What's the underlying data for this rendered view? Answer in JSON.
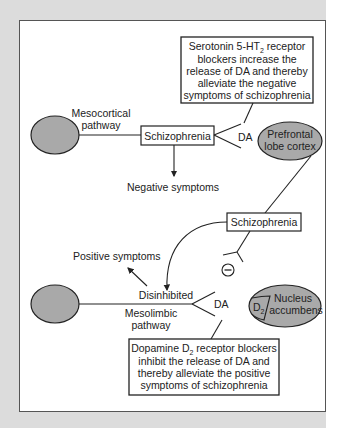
{
  "figure": {
    "title_cutoff": "",
    "colors": {
      "background": "#dcdcdc",
      "panel": "#ffffff",
      "ellipse_fill": "#a9a9a9",
      "stroke": "#222222"
    },
    "top_box": {
      "lines": [
        "Serotonin 5-HT",
        "blockers increase the",
        "release of DA and thereby",
        "alleviate the negative",
        "symptoms of schizophrenia"
      ],
      "line1_sub": "2",
      "line1_suffix": " receptor"
    },
    "mesocortical": {
      "label_line1": "Mesocortical",
      "label_line2": "pathway",
      "schizophrenia_box": "Schizophrenia",
      "da_label": "DA",
      "negative_symptoms": "Negative symptoms",
      "target_line1": "Prefrontal",
      "target_line2": "lobe cortex"
    },
    "middle": {
      "schizophrenia_box": "Schizophrenia",
      "inhibit_symbol": "⊖"
    },
    "mesolimbic": {
      "positive_symptoms": "Positive symptoms",
      "disinhibited": "Disinhibited",
      "label_line1": "Mesolimbic",
      "label_line2": "pathway",
      "da_label": "DA",
      "target_line1": "Nucleus",
      "target_line2": "accumbens",
      "receptor": "D",
      "receptor_sub": "2"
    },
    "bottom_box": {
      "line1_prefix": "Dopamine D",
      "line1_sub": "2",
      "line1_suffix": " receptor blockers",
      "lines": [
        "inhibit the release of DA and",
        "thereby alleviate the positive",
        "symptoms of schizophrenia"
      ]
    }
  }
}
